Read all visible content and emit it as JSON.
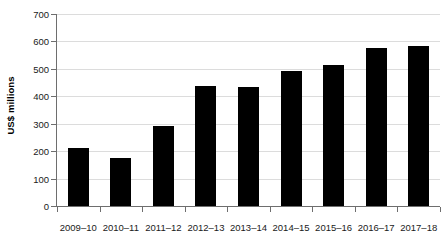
{
  "chart_data": {
    "type": "bar",
    "title": "",
    "xlabel": "",
    "ylabel": "US$ millions",
    "ylim": [
      0,
      700
    ],
    "ytick_step": 100,
    "yticks": [
      0,
      100,
      200,
      300,
      400,
      500,
      600,
      700
    ],
    "grid": true,
    "legend": "none",
    "bar_color": "#000000",
    "gridline_color": "#dcdcdc",
    "axis_color": "#6e6e6e",
    "categories": [
      "2009–10",
      "2010–11",
      "2011–12",
      "2012–13",
      "2013–14",
      "2014–15",
      "2015–16",
      "2016–17",
      "2017–18"
    ],
    "values": [
      213,
      176,
      292,
      437,
      434,
      491,
      515,
      575,
      582
    ],
    "series": [
      {
        "name": "US$ millions",
        "values": [
          213,
          176,
          292,
          437,
          434,
          491,
          515,
          575,
          582
        ]
      }
    ]
  }
}
